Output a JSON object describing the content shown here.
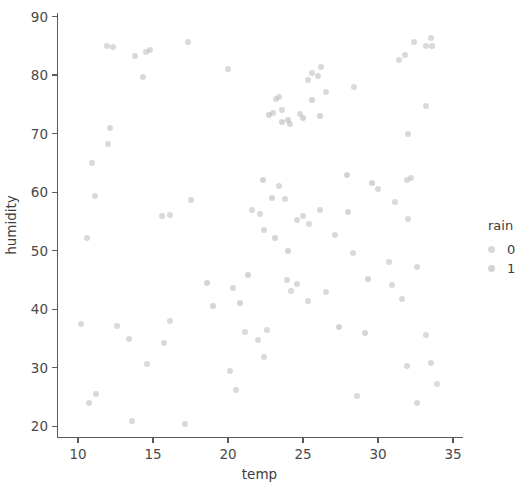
{
  "chart_data": {
    "type": "scatter",
    "title": "",
    "xlabel": "temp",
    "ylabel": "humidity",
    "xlim": [
      8.6,
      35.6
    ],
    "ylim": [
      18.2,
      90.6
    ],
    "xticks": [
      10,
      15,
      20,
      25,
      30,
      35
    ],
    "yticks": [
      20,
      30,
      40,
      50,
      60,
      70,
      80,
      90
    ],
    "grid": false,
    "legend": {
      "title": "rain",
      "position": "right",
      "entries": [
        {
          "label": "0",
          "color": "#b9b9b9"
        },
        {
          "label": "1",
          "color": "#b1b1b1"
        }
      ]
    },
    "marker": {
      "shape": "circle",
      "size": 6,
      "opacity": 0.55,
      "color": "#b3b3b3"
    },
    "series": [
      {
        "name": "0",
        "color": "#b9b9b9",
        "points": [
          [
            11.9,
            84.9
          ],
          [
            12.3,
            84.8
          ],
          [
            13.8,
            83.2
          ],
          [
            14.5,
            84.0
          ],
          [
            14.8,
            84.3
          ],
          [
            17.3,
            85.6
          ],
          [
            14.3,
            79.6
          ],
          [
            20.0,
            81.0
          ],
          [
            10.9,
            65.0
          ],
          [
            12.1,
            70.9
          ],
          [
            12.0,
            68.2
          ],
          [
            11.1,
            59.4
          ],
          [
            10.6,
            52.1
          ],
          [
            15.6,
            56.0
          ],
          [
            16.1,
            56.1
          ],
          [
            17.5,
            58.6
          ],
          [
            10.2,
            37.5
          ],
          [
            12.6,
            37.2
          ],
          [
            13.4,
            35.0
          ],
          [
            14.6,
            30.6
          ],
          [
            15.7,
            34.2
          ],
          [
            16.1,
            38.0
          ],
          [
            11.2,
            25.5
          ],
          [
            10.7,
            24.0
          ],
          [
            13.6,
            21.0
          ],
          [
            17.1,
            20.4
          ],
          [
            20.3,
            43.6
          ],
          [
            20.1,
            29.5
          ],
          [
            20.5,
            26.2
          ],
          [
            21.6,
            57.0
          ],
          [
            22.1,
            56.2
          ],
          [
            22.4,
            53.5
          ],
          [
            21.1,
            36.1
          ],
          [
            22.0,
            34.7
          ],
          [
            22.6,
            36.4
          ],
          [
            22.4,
            31.9
          ],
          [
            23.2,
            75.9
          ],
          [
            23.4,
            76.3
          ],
          [
            23.0,
            73.5
          ],
          [
            23.6,
            74.1
          ],
          [
            24.1,
            71.6
          ],
          [
            24.8,
            73.4
          ],
          [
            25.3,
            79.1
          ],
          [
            25.6,
            80.3
          ],
          [
            26.0,
            79.9
          ],
          [
            26.2,
            81.4
          ],
          [
            26.5,
            77.1
          ],
          [
            28.4,
            78.0
          ],
          [
            23.8,
            58.8
          ],
          [
            24.6,
            55.3
          ],
          [
            25.0,
            56.0
          ],
          [
            25.4,
            54.6
          ],
          [
            26.1,
            57.0
          ],
          [
            23.9,
            45.0
          ],
          [
            24.2,
            43.1
          ],
          [
            24.6,
            44.4
          ],
          [
            25.3,
            41.5
          ],
          [
            26.5,
            42.9
          ],
          [
            23.4,
            61.0
          ],
          [
            27.1,
            52.7
          ],
          [
            28.3,
            49.6
          ],
          [
            28.6,
            25.2
          ],
          [
            30.0,
            60.6
          ],
          [
            30.7,
            48.0
          ],
          [
            31.4,
            82.6
          ],
          [
            31.8,
            83.4
          ],
          [
            32.4,
            85.6
          ],
          [
            33.2,
            84.9
          ],
          [
            33.5,
            86.3
          ],
          [
            33.6,
            85.0
          ],
          [
            33.2,
            74.8
          ],
          [
            32.0,
            69.9
          ],
          [
            31.9,
            62.1
          ],
          [
            32.2,
            62.5
          ],
          [
            31.1,
            58.3
          ],
          [
            32.0,
            55.4
          ],
          [
            30.9,
            44.2
          ],
          [
            31.6,
            41.8
          ],
          [
            32.6,
            47.3
          ],
          [
            33.2,
            35.7
          ],
          [
            31.9,
            30.4
          ],
          [
            32.6,
            24.0
          ],
          [
            33.9,
            27.2
          ],
          [
            33.5,
            30.8
          ]
        ]
      },
      {
        "name": "1",
        "color": "#b1b1b1",
        "points": [
          [
            22.7,
            73.2
          ],
          [
            23.6,
            72.0
          ],
          [
            24.0,
            72.4
          ],
          [
            25.0,
            72.7
          ],
          [
            26.1,
            73.0
          ],
          [
            25.6,
            75.7
          ],
          [
            22.3,
            62.0
          ],
          [
            22.9,
            59.0
          ],
          [
            23.1,
            52.1
          ],
          [
            24.0,
            50.0
          ],
          [
            21.3,
            45.9
          ],
          [
            20.8,
            41.0
          ],
          [
            27.4,
            37.0
          ],
          [
            29.1,
            35.9
          ],
          [
            18.6,
            44.5
          ],
          [
            19.0,
            40.5
          ],
          [
            27.9,
            62.9
          ],
          [
            29.6,
            61.5
          ],
          [
            28.0,
            56.6
          ],
          [
            29.3,
            45.2
          ]
        ]
      }
    ]
  },
  "axis": {
    "xlabel": "temp",
    "ylabel": "humidity",
    "xtick_labels": [
      "10",
      "15",
      "20",
      "25",
      "30",
      "35"
    ],
    "ytick_labels": [
      "20",
      "30",
      "40",
      "50",
      "60",
      "70",
      "80",
      "90"
    ]
  },
  "legend": {
    "title": "rain",
    "items": [
      {
        "label": "0"
      },
      {
        "label": "1"
      }
    ]
  }
}
